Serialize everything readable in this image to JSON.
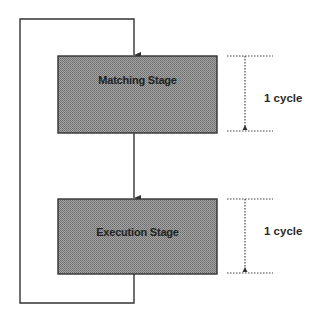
{
  "diagram": {
    "type": "pipeline-loop",
    "stages": [
      {
        "label": "Matching Stage",
        "duration_label": "1 cycle"
      },
      {
        "label": "Execution Stage",
        "duration_label": "1 cycle"
      }
    ],
    "colors": {
      "box_fill": "#8f8f8f",
      "box_pattern_dark": "#6e6e6e",
      "box_pattern_light": "#b0b0b0",
      "line": "#333333",
      "dotted": "#444444"
    }
  }
}
